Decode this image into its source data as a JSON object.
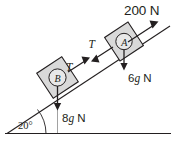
{
  "diagram": {
    "kind": "inclined-plane-free-body-diagram",
    "incline_angle_label": "20°",
    "applied_force_label": "200 N",
    "tension_label_upper": "T",
    "tension_label_lower": "T",
    "blocks": [
      {
        "id": "A",
        "letter": "A",
        "weight_label": "6g N"
      },
      {
        "id": "B",
        "letter": "B",
        "weight_label": "8g N"
      }
    ],
    "weight_a_label": "6g N",
    "weight_a_value": "6",
    "weight_a_unit": "g N",
    "weight_b_label": "8g N",
    "weight_b_value": "8",
    "weight_b_unit": "g N",
    "colors": {
      "stroke": "#231f20",
      "block_fill": "#d9d9d9",
      "circle_fill": "#e8e8e8",
      "background": "#ffffff"
    }
  }
}
